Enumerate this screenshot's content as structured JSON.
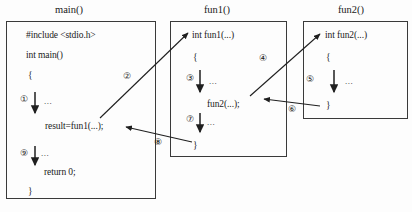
{
  "diagram": {
    "kind": "c-function-call-flow",
    "boxes": [
      {
        "id": "main",
        "title": "main()",
        "lines": [
          "#include <stdio.h>",
          "int main()",
          "{",
          "result=fun1(...);",
          "return 0;",
          "}"
        ]
      },
      {
        "id": "fun1",
        "title": "fun1()",
        "lines": [
          "int fun1(...)",
          "{",
          "fun2(...);",
          "}"
        ]
      },
      {
        "id": "fun2",
        "title": "fun2()",
        "lines": [
          "int fun2(...)",
          "{",
          "}"
        ]
      }
    ],
    "steps": [
      {
        "n": "①",
        "label": "1",
        "where": "main-body-flow"
      },
      {
        "n": "②",
        "label": "2",
        "where": "main-calls-fun1"
      },
      {
        "n": "③",
        "label": "3",
        "where": "fun1-body-flow"
      },
      {
        "n": "④",
        "label": "4",
        "where": "fun1-calls-fun2"
      },
      {
        "n": "⑤",
        "label": "5",
        "where": "fun2-body-flow"
      },
      {
        "n": "⑥",
        "label": "6",
        "where": "fun2-returns-to-fun1"
      },
      {
        "n": "⑦",
        "label": "7",
        "where": "fun1-body-flow-after-call"
      },
      {
        "n": "⑧",
        "label": "8",
        "where": "fun1-returns-to-main"
      },
      {
        "n": "⑨",
        "label": "9",
        "where": "main-body-flow-after-call"
      }
    ],
    "ellipsis": "...",
    "caption": ""
  }
}
